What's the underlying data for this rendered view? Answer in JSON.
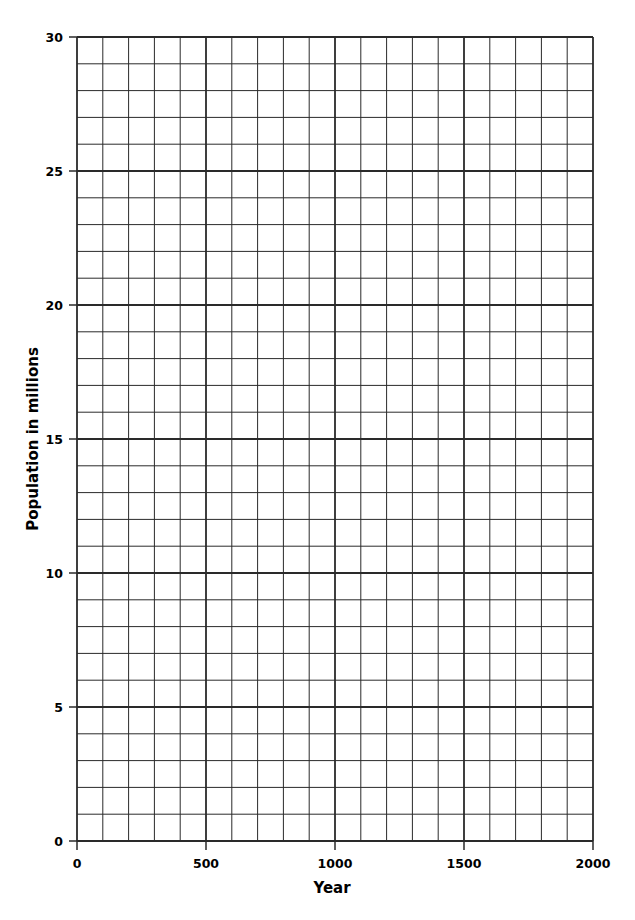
{
  "chart_data": {
    "type": "line",
    "title": "",
    "xlabel": "Year",
    "ylabel": "Population in millions",
    "xlim": [
      0,
      2000
    ],
    "ylim": [
      0,
      30
    ],
    "x_ticks": [
      0,
      500,
      1000,
      1500,
      2000
    ],
    "y_ticks": [
      0,
      5,
      10,
      15,
      20,
      25,
      30
    ],
    "x_minor_step": 100,
    "y_minor_step": 1,
    "grid": true,
    "legend": null,
    "series": [],
    "note": "Blank graph-paper grid with no plotted data"
  },
  "colors": {
    "grid_line": "#2a2a2a",
    "text": "#1a1a1a",
    "background": "#ffffff"
  }
}
